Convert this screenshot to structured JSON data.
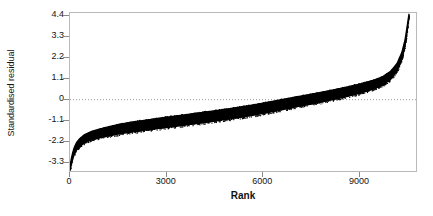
{
  "chart_data": {
    "type": "scatter",
    "title": "",
    "xlabel": "Rank",
    "ylabel": "Standardised residual",
    "xlim": [
      0,
      10800
    ],
    "ylim": [
      -3.85,
      4.55
    ],
    "xticks": [
      0,
      3000,
      6000,
      9000
    ],
    "xtick_labels": [
      "0",
      "3000",
      "6000",
      "9000"
    ],
    "yticks": [
      4.4,
      3.3,
      2.2,
      1.1,
      0,
      -1.1,
      -2.2,
      -3.3
    ],
    "ytick_labels": [
      "4.4",
      "3.3",
      "2.2",
      "1.1",
      "0",
      "-1.1",
      "-2.2",
      "-3.3"
    ],
    "grid": false,
    "reference_line": {
      "y": 0,
      "style": "dotted",
      "color": "#9a9a9a"
    },
    "legend": null,
    "n_points": 10500,
    "marker_color": "#000000",
    "x": [
      0,
      60,
      120,
      200,
      300,
      450,
      650,
      900,
      1200,
      1600,
      2000,
      2500,
      3000,
      3500,
      4000,
      4500,
      5000,
      5500,
      6000,
      6400,
      7000,
      7500,
      8000,
      8500,
      9000,
      9400,
      9700,
      9950,
      10150,
      10300,
      10400,
      10470,
      10520
    ],
    "y": [
      -3.6,
      -3.1,
      -2.75,
      -2.45,
      -2.25,
      -2.05,
      -1.9,
      -1.78,
      -1.66,
      -1.52,
      -1.42,
      -1.3,
      -1.19,
      -1.08,
      -0.97,
      -0.85,
      -0.73,
      -0.6,
      -0.45,
      -0.32,
      -0.12,
      0.03,
      0.2,
      0.38,
      0.58,
      0.78,
      0.98,
      1.28,
      1.7,
      2.3,
      3.0,
      3.8,
      4.4
    ],
    "band_halfwidth": [
      0.12,
      0.16,
      0.18,
      0.19,
      0.2,
      0.21,
      0.22,
      0.23,
      0.24,
      0.25,
      0.26,
      0.26,
      0.27,
      0.27,
      0.27,
      0.27,
      0.27,
      0.27,
      0.27,
      0.27,
      0.26,
      0.26,
      0.25,
      0.25,
      0.24,
      0.23,
      0.22,
      0.21,
      0.2,
      0.18,
      0.15,
      0.12,
      0.08
    ]
  },
  "axes": {
    "y_title": "Standardised residual",
    "x_title": "Rank"
  }
}
